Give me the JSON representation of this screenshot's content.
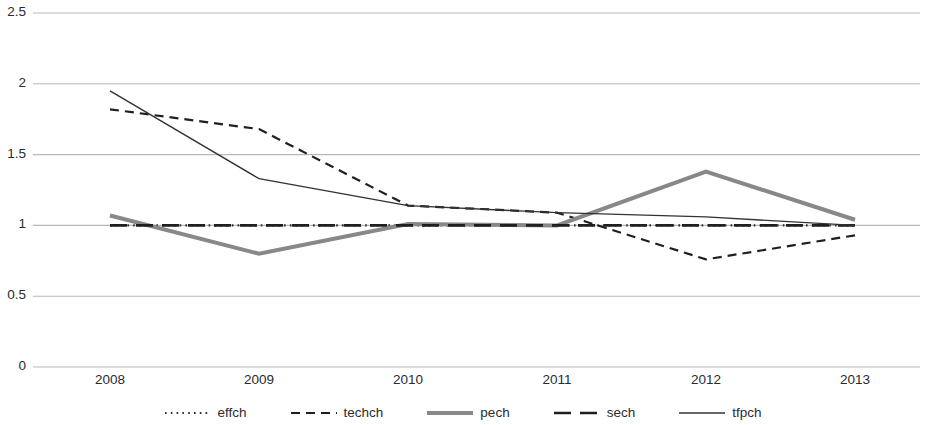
{
  "chart_data": {
    "type": "line",
    "title": "",
    "xlabel": "",
    "ylabel": "",
    "categories": [
      "2008",
      "2009",
      "2010",
      "2011",
      "2012",
      "2013"
    ],
    "ylim": [
      0,
      2.5
    ],
    "yticks": [
      "0",
      "0.5",
      "1",
      "1.5",
      "2",
      "2.5"
    ],
    "ytick_values": [
      0,
      0.5,
      1,
      1.5,
      2,
      2.5
    ],
    "grid": "horizontal",
    "legend_position": "bottom",
    "series": [
      {
        "name": "effch",
        "style": "dotted",
        "color": "#2b2b2b",
        "width": 2.2,
        "values": [
          1.0,
          1.0,
          1.0,
          1.0,
          1.0,
          1.0
        ]
      },
      {
        "name": "techch",
        "style": "dashed",
        "color": "#1f1f1f",
        "width": 2.2,
        "values": [
          1.82,
          1.68,
          1.14,
          1.09,
          0.76,
          0.93
        ]
      },
      {
        "name": "pech",
        "style": "solid",
        "color": "#888888",
        "width": 4.0,
        "values": [
          1.07,
          0.8,
          1.01,
          1.0,
          1.38,
          1.04
        ]
      },
      {
        "name": "sech",
        "style": "longdash",
        "color": "#1f1f1f",
        "width": 2.6,
        "values": [
          1.0,
          1.0,
          1.0,
          1.0,
          1.0,
          1.0
        ]
      },
      {
        "name": "tfpch",
        "style": "solid-thin",
        "color": "#333333",
        "width": 1.4,
        "values": [
          1.95,
          1.33,
          1.14,
          1.09,
          1.06,
          1.0
        ]
      }
    ]
  },
  "legend": {
    "items": [
      {
        "label": "effch"
      },
      {
        "label": "techch"
      },
      {
        "label": "pech"
      },
      {
        "label": "sech"
      },
      {
        "label": "tfpch"
      }
    ]
  },
  "axes": {
    "y_labels": [
      "2.5",
      "2",
      "1.5",
      "1",
      "0.5",
      "0"
    ],
    "x_labels": [
      "2008",
      "2009",
      "2010",
      "2011",
      "2012",
      "2013"
    ]
  },
  "colors": {
    "grid": "#b9b9b9",
    "text": "#2b2b2b",
    "pech": "#888888",
    "dark": "#1f1f1f"
  }
}
